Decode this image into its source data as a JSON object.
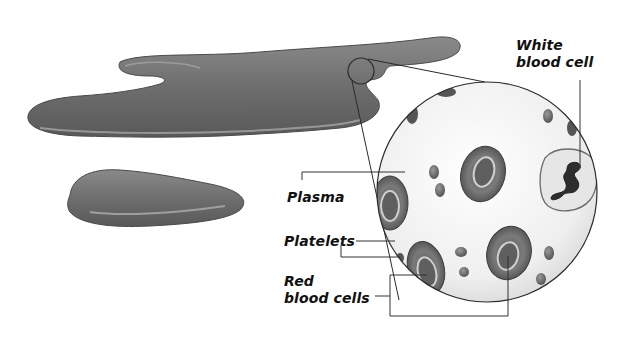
{
  "diagram": {
    "labels": {
      "white_blood_cell_line1": "White",
      "white_blood_cell_line2": "blood cell",
      "plasma": "Plasma",
      "platelets": "Platelets",
      "red_blood_cells_line1": "Red",
      "red_blood_cells_line2": "blood cells"
    },
    "colors": {
      "puddle": "#6f6f6f",
      "puddle_highlight": "#b8b8b8",
      "magnified_background": "#f2f2f2",
      "red_cell": "#6a6a6a",
      "white_cell": "#e4e4e4",
      "leader_line": "#333333"
    }
  }
}
